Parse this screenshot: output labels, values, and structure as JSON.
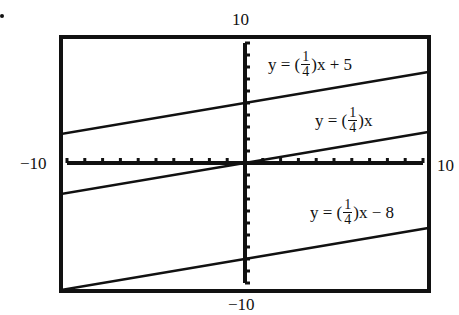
{
  "chart_data": {
    "type": "line",
    "title": "",
    "xlabel": "",
    "ylabel": "",
    "xlim": [
      -10,
      10
    ],
    "ylim": [
      -10,
      10
    ],
    "grid": false,
    "axis_tick_labels": {
      "x_min": "−10",
      "x_max": "10",
      "y_min": "−10",
      "y_max": "10"
    },
    "x_tick_step": 1,
    "y_tick_step": 1,
    "series": [
      {
        "name": "y = (1/4)x + 5",
        "slope": 0.25,
        "intercept": 5,
        "x": [
          -10.4,
          10.3
        ],
        "values": [
          2.4,
          7.575
        ]
      },
      {
        "name": "y = (1/4)x",
        "slope": 0.25,
        "intercept": 0,
        "x": [
          -10.4,
          10.3
        ],
        "values": [
          -2.6,
          2.575
        ]
      },
      {
        "name": "y = (1/4)x − 8",
        "slope": 0.25,
        "intercept": -8,
        "x": [
          -10.4,
          10.3
        ],
        "values": [
          -10.6,
          -5.425
        ]
      }
    ],
    "annotations": [
      {
        "text": "y = (1/4)x + 5",
        "near_series": 0
      },
      {
        "text": "y = (1/4)x",
        "near_series": 1
      },
      {
        "text": "y = (1/4)x − 8",
        "near_series": 2
      }
    ]
  },
  "labels": {
    "y_max": "10",
    "y_min": "−10",
    "x_min": "−10",
    "x_max": "10"
  },
  "equations": [
    {
      "prefix": "y = (",
      "num": "1",
      "den": "4",
      "suffix": ")x + 5"
    },
    {
      "prefix": "y = (",
      "num": "1",
      "den": "4",
      "suffix": ")x"
    },
    {
      "prefix": "y = (",
      "num": "1",
      "den": "4",
      "suffix": ")x − 8"
    }
  ]
}
